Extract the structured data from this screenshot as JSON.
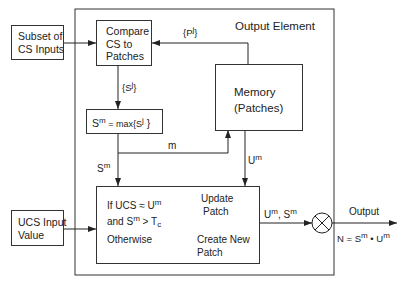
{
  "diagram": {
    "outer_title": "Output Element",
    "inputs": {
      "cs_inputs": {
        "line1": "Subset of",
        "line2": "CS Inputs"
      },
      "ucs_input": {
        "line1": "UCS Input",
        "line2": "Value"
      }
    },
    "compare_box": {
      "line1": "Compare",
      "line2": "CS  to",
      "line3": "Patches"
    },
    "max_box": {
      "base": "S",
      "sup": "m",
      "mid": " = max{S",
      "sup2": "j",
      "end": " }"
    },
    "memory_box": {
      "line1": "Memory",
      "line2": "(Patches)"
    },
    "decision_box": {
      "cond1_prefix": "If  UCS   ≈ U",
      "cond1_sup": "m",
      "cond2_prefix": "and  S",
      "cond2_sup": "m",
      "cond2_mid": "  >  T",
      "cond2_sub": "c",
      "otherwise": "Otherwise",
      "update_line1": "Update",
      "update_line2": "Patch",
      "create_line1": "Create New",
      "create_line2": "Patch"
    },
    "edge_labels": {
      "pj": {
        "base": "{P",
        "sup": "j",
        "end": "}"
      },
      "sj": {
        "base": "{S",
        "sup": "j",
        "end": "}"
      },
      "sm": {
        "base": "S",
        "sup": "m"
      },
      "m": "m",
      "um": {
        "base": "U",
        "sup": "m"
      },
      "um_sm": {
        "a": "U",
        "a_sup": "m",
        "sep": ",  S",
        "b_sup": "m"
      }
    },
    "output": {
      "label": "Output",
      "formula_prefix": "N = S",
      "formula_sup1": "m",
      "formula_mid": " • U",
      "formula_sup2": "m"
    },
    "multiplier_symbol": "circle-x"
  }
}
